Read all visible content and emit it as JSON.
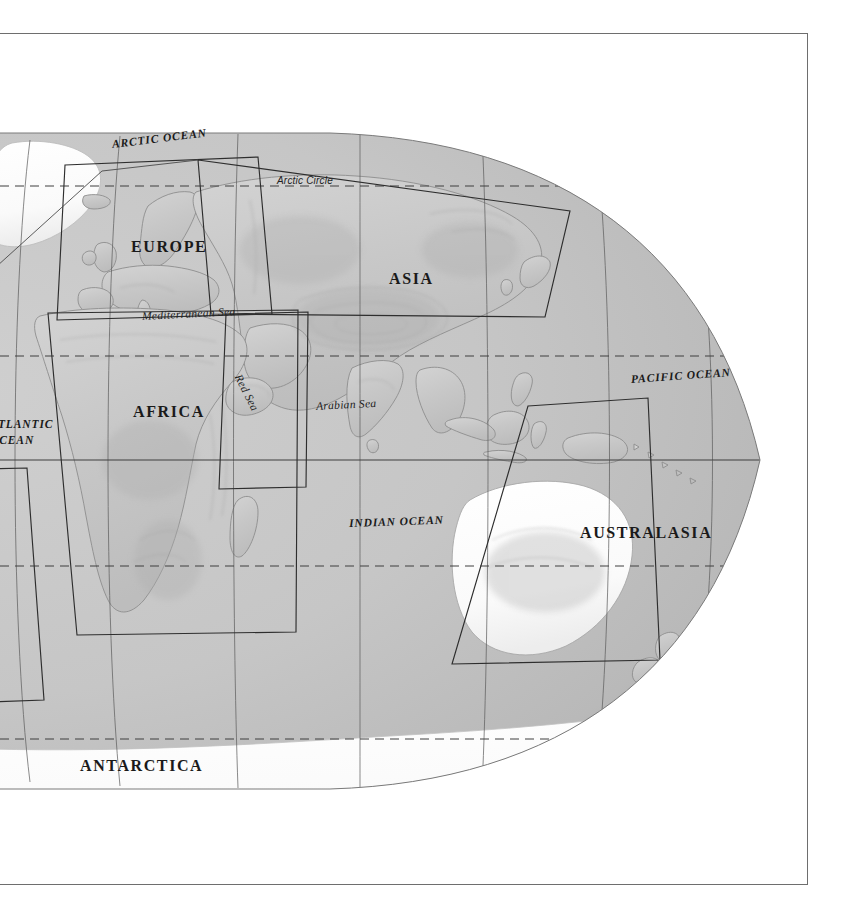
{
  "page": {
    "projection": "oval (Mollweide-style) world projection",
    "sheet_border_color": "#6e6e6e",
    "background_color": "#ffffff"
  },
  "map": {
    "land_color": "#c9c9c9",
    "ocean_color": "#c4c4c4",
    "ice_color": "#fbfbfb",
    "coastline_color": "#8d8d8d",
    "graticule_color": "#4a4a4a",
    "index_box_color": "#2e2e2e"
  },
  "continent_labels": [
    {
      "name": "europe",
      "text": "EUROPE",
      "x": 131,
      "y": 238,
      "size": "big"
    },
    {
      "name": "asia",
      "text": "ASIA",
      "x": 389,
      "y": 270,
      "size": "big"
    },
    {
      "name": "africa",
      "text": "AFRICA",
      "x": 133,
      "y": 403,
      "size": "big"
    },
    {
      "name": "australasia",
      "text": "AUSTRALASIA",
      "x": 580,
      "y": 524,
      "size": "big"
    },
    {
      "name": "antarctica",
      "text": "ANTARCTICA",
      "x": 80,
      "y": 757,
      "size": "big"
    }
  ],
  "ocean_labels": [
    {
      "name": "arctic-ocean",
      "text": "ARCTIC OCEAN",
      "x": 112,
      "y": 138,
      "rotate": -7
    },
    {
      "name": "atlantic-ocean",
      "text": "ATLANTIC",
      "x": -10,
      "y": 418,
      "rotate": 0
    },
    {
      "name": "atlantic-ocean-2",
      "text": "OCEAN",
      "x": -10,
      "y": 434,
      "rotate": 0
    },
    {
      "name": "pacific-ocean",
      "text": "PACIFIC OCEAN",
      "x": 631,
      "y": 373,
      "rotate": -4
    },
    {
      "name": "indian-ocean",
      "text": "INDIAN OCEAN",
      "x": 349,
      "y": 517,
      "rotate": -2
    }
  ],
  "sea_labels": [
    {
      "name": "mediterranean-sea",
      "text": "Mediterranean  Sea",
      "x": 142,
      "y": 310,
      "rotate": -3
    },
    {
      "name": "arabian-sea",
      "text": "Arabian Sea",
      "x": 316,
      "y": 400,
      "rotate": -3
    },
    {
      "name": "red-sea",
      "text": "Red Sea",
      "x": 238,
      "y": 369,
      "rotate": 63
    }
  ],
  "latitude_labels": [
    {
      "name": "arctic-circle",
      "text": "Arctic Circle",
      "x": 277,
      "y": 175
    }
  ],
  "latitude_lines": [
    {
      "name": "arctic-circle-line",
      "style": "dashed",
      "y": 186
    },
    {
      "name": "tropic-of-cancer",
      "style": "dashed",
      "y": 356
    },
    {
      "name": "equator",
      "style": "solid",
      "y": 460
    },
    {
      "name": "tropic-of-capricorn",
      "style": "dashed",
      "y": 566
    },
    {
      "name": "antarctic-circle-line",
      "style": "dashed",
      "y": 739
    }
  ],
  "index_boxes": [
    {
      "name": "index-box-europe",
      "region": "EUROPE"
    },
    {
      "name": "index-box-asia",
      "region": "ASIA"
    },
    {
      "name": "index-box-africa",
      "region": "AFRICA"
    },
    {
      "name": "index-box-middle-east",
      "region": "MIDDLE EAST"
    },
    {
      "name": "index-box-australasia",
      "region": "AUSTRALASIA"
    },
    {
      "name": "index-box-south-america",
      "region": "SOUTH AMERICA"
    }
  ]
}
